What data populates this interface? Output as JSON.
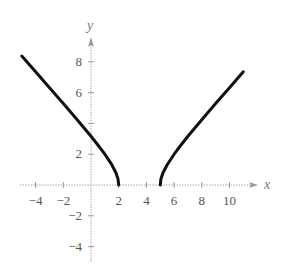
{
  "chart_data": {
    "type": "line",
    "title": "",
    "xlabel": "x",
    "ylabel": "y",
    "xlim": [
      -5,
      11.5
    ],
    "ylim": [
      -5,
      9.5
    ],
    "grid": false,
    "legend": null,
    "x_ticks": [
      -4,
      -2,
      2,
      4,
      6,
      8,
      10
    ],
    "x_tick_labels": [
      "−4",
      "−2",
      "2",
      "4",
      "6",
      "8",
      "10"
    ],
    "y_ticks": [
      8,
      6,
      4,
      2,
      -2,
      -4
    ],
    "y_tick_labels": [
      "8",
      "6",
      "",
      "2",
      "−2",
      "−4"
    ],
    "function_hint": "y = sqrt((x-2)(x-5))",
    "series": [
      {
        "name": "left-branch",
        "x": [
          -5,
          -4,
          -3,
          -2,
          -1,
          0,
          0.5,
          1,
          1.5,
          1.8,
          1.95,
          2
        ],
        "y": [
          8.37,
          7.35,
          6.32,
          5.29,
          4.24,
          3.16,
          2.6,
          2.0,
          1.32,
          0.8,
          0.39,
          0
        ],
        "color": "#111111"
      },
      {
        "name": "right-branch",
        "x": [
          5,
          5.05,
          5.2,
          5.5,
          6,
          6.5,
          7,
          8,
          9,
          10,
          11
        ],
        "y": [
          0,
          0.39,
          0.8,
          1.32,
          2.0,
          2.6,
          3.16,
          4.24,
          5.29,
          6.32,
          7.35
        ],
        "color": "#111111"
      }
    ]
  },
  "axes": {
    "x_label": "x",
    "y_label": "y"
  },
  "layout": {
    "origin_px": [
      91,
      185
    ],
    "x_scale": 13.85,
    "y_scale": 15.4
  }
}
